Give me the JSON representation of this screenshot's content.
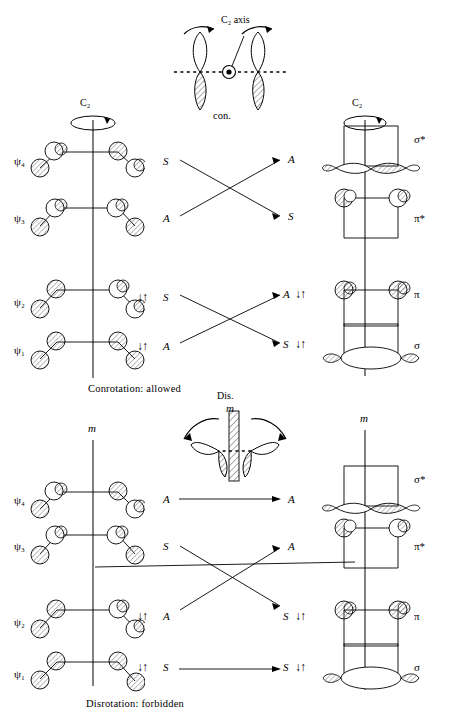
{
  "figure": {
    "kind": "orbital-correlation-diagram"
  },
  "panels": [
    {
      "id": "conrotatory",
      "symmetry_element": "C2",
      "symmetry_element_label": "C₂",
      "top_inset": {
        "axis_label": "C₂ axis",
        "mode_label": "con.",
        "arrow_dir": "both-same-sense"
      },
      "left_axis_label": "C₂",
      "right_axis_label": "C₂",
      "caption": "Conrotation: allowed",
      "reactant_levels": [
        {
          "label": "ψ₄",
          "symmetry": "S",
          "electrons": 0,
          "nodes": 3
        },
        {
          "label": "ψ₃",
          "symmetry": "A",
          "electrons": 0,
          "nodes": 2
        },
        {
          "label": "ψ₂",
          "symmetry": "S",
          "electrons": 2,
          "nodes": 1
        },
        {
          "label": "ψ₁",
          "symmetry": "A",
          "electrons": 2,
          "nodes": 0
        }
      ],
      "product_levels": [
        {
          "label": "σ*",
          "symmetry": "A",
          "electrons": 0
        },
        {
          "label": "π*",
          "symmetry": "S",
          "electrons": 0
        },
        {
          "label": "π",
          "symmetry": "A",
          "electrons": 2
        },
        {
          "label": "σ",
          "symmetry": "S",
          "electrons": 2
        }
      ],
      "correlations": [
        {
          "from": "ψ₄",
          "from_sym": "S",
          "to": "π*",
          "to_sym": "S",
          "crossing": true
        },
        {
          "from": "ψ₃",
          "from_sym": "A",
          "to": "σ*",
          "to_sym": "A",
          "crossing": true
        },
        {
          "from": "ψ₂",
          "from_sym": "S",
          "to": "σ",
          "to_sym": "S",
          "crossing": true
        },
        {
          "from": "ψ₁",
          "from_sym": "A",
          "to": "π",
          "to_sym": "A",
          "crossing": true
        }
      ],
      "electron_pair_glyph": "↓↑"
    },
    {
      "id": "disrotatory",
      "symmetry_element": "m",
      "symmetry_element_label": "m",
      "top_inset": {
        "axis_label": "Dis.",
        "mirror_label": "m",
        "mode_label": "",
        "arrow_dir": "outward-opposite-sense"
      },
      "left_axis_label": "m",
      "right_axis_label": "m",
      "caption": "Disrotation: forbidden",
      "reactant_levels": [
        {
          "label": "ψ₄",
          "symmetry": "A",
          "electrons": 0,
          "nodes": 3
        },
        {
          "label": "ψ₃",
          "symmetry": "S",
          "electrons": 0,
          "nodes": 2
        },
        {
          "label": "ψ₂",
          "symmetry": "A",
          "electrons": 2,
          "nodes": 1
        },
        {
          "label": "ψ₁",
          "symmetry": "S",
          "electrons": 2,
          "nodes": 0
        }
      ],
      "product_levels": [
        {
          "label": "σ*",
          "symmetry": "A",
          "electrons": 0
        },
        {
          "label": "π*",
          "symmetry": "A",
          "electrons": 0
        },
        {
          "label": "π",
          "symmetry": "S",
          "electrons": 2
        },
        {
          "label": "σ",
          "symmetry": "S",
          "electrons": 2
        }
      ],
      "correlations": [
        {
          "from": "ψ₄",
          "from_sym": "A",
          "to": "σ*",
          "to_sym": "A",
          "crossing": false
        },
        {
          "from": "ψ₃",
          "from_sym": "S",
          "to": "π",
          "to_sym": "S",
          "crossing": true
        },
        {
          "from": "ψ₂",
          "from_sym": "A",
          "to": "π*",
          "to_sym": "A",
          "crossing": true
        },
        {
          "from": "ψ₁",
          "from_sym": "S",
          "to": "σ",
          "to_sym": "S",
          "crossing": false
        }
      ],
      "electron_pair_glyph": "↓↑"
    }
  ],
  "colors": {
    "ink": "#1a1a1a",
    "hatch": "#555555",
    "background": "#ffffff"
  }
}
